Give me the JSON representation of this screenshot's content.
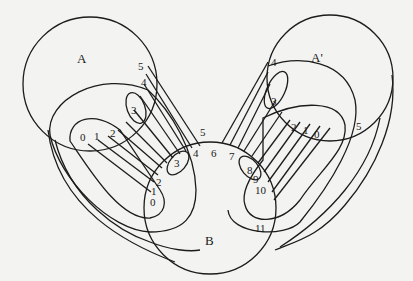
{
  "diagram": {
    "sets": [
      {
        "id": "A",
        "label": "A"
      },
      {
        "id": "A_prime",
        "label": "A'"
      },
      {
        "id": "B",
        "label": "B"
      }
    ],
    "labels_A": [
      "0",
      "1",
      "2",
      "3",
      "4",
      "5"
    ],
    "labels_A_prime": [
      "0",
      "1",
      "2",
      "3",
      "4",
      "5"
    ],
    "labels_B_left": [
      "0",
      "1",
      "2",
      "3",
      "4",
      "5"
    ],
    "labels_B_right": [
      "6",
      "7",
      "8",
      "9",
      "10",
      "11"
    ],
    "colors": {
      "line": "#1c1c1c",
      "background": "#f3f3f1"
    }
  }
}
